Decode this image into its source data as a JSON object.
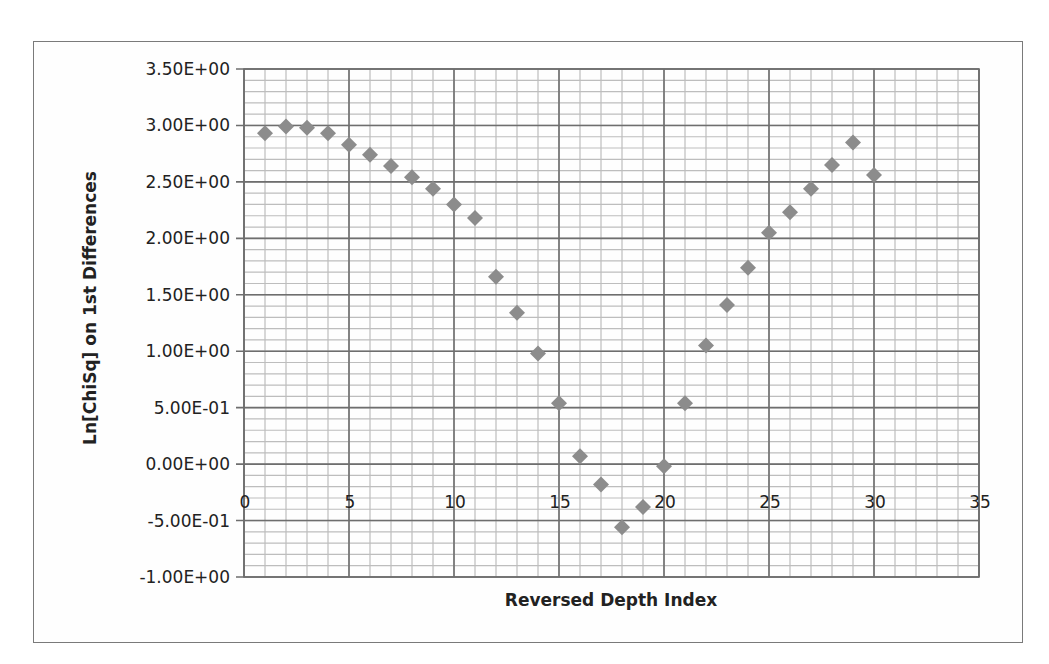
{
  "chart_data": {
    "type": "scatter",
    "title": "",
    "xlabel": "Reversed Depth Index",
    "ylabel": "Ln[ChiSq] on 1st Differences",
    "xlim": [
      0,
      35
    ],
    "ylim": [
      -1.0,
      3.5
    ],
    "x_ticks": [
      0,
      5,
      10,
      15,
      20,
      25,
      30,
      35
    ],
    "x_tick_labels": [
      "0",
      "5",
      "10",
      "15",
      "20",
      "25",
      "30",
      "35"
    ],
    "y_ticks": [
      3.5,
      3.0,
      2.5,
      2.0,
      1.5,
      1.0,
      0.5,
      0.0,
      -0.5,
      -1.0
    ],
    "y_tick_labels": [
      "3.50E+00",
      "3.00E+00",
      "2.50E+00",
      "2.00E+00",
      "1.50E+00",
      "1.00E+00",
      "5.00E-01",
      "0.00E+00",
      "-5.00E-01",
      "-1.00E+00"
    ],
    "grid": {
      "major": true,
      "minor": true,
      "x_minor_step": 1,
      "y_minor_step": 0.1
    },
    "legend": null,
    "marker": "diamond",
    "marker_color": "#8c8c8c",
    "series": [
      {
        "name": "Ln[ChiSq]",
        "x": [
          1,
          2,
          3,
          4,
          5,
          6,
          7,
          8,
          9,
          10,
          11,
          12,
          13,
          14,
          15,
          16,
          17,
          18,
          19,
          20,
          21,
          22,
          23,
          24,
          25,
          26,
          27,
          28,
          29,
          30
        ],
        "values": [
          2.93,
          2.99,
          2.98,
          2.93,
          2.83,
          2.74,
          2.64,
          2.54,
          2.44,
          2.3,
          2.18,
          1.66,
          1.34,
          0.98,
          0.54,
          0.07,
          -0.18,
          -0.56,
          -0.38,
          -0.02,
          0.54,
          1.05,
          1.41,
          1.74,
          2.05,
          2.23,
          2.44,
          2.65,
          2.85,
          2.56
        ]
      }
    ]
  }
}
